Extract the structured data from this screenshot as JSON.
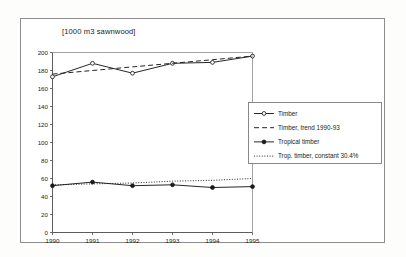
{
  "figure": {
    "title": "[1000 m3 sawnwood]",
    "frame_color": "#8d8d8d",
    "background": "#ffffff"
  },
  "chart_data": {
    "type": "line",
    "title": "[1000 m3 sawnwood]",
    "xlabel": "",
    "ylabel": "",
    "x": [
      1990,
      1991,
      1992,
      1993,
      1994,
      1995
    ],
    "categories": [
      "1990",
      "1991",
      "1992",
      "1993",
      "1994",
      "1995"
    ],
    "xlim": [
      1990,
      1995
    ],
    "ylim": [
      0,
      200
    ],
    "yticks": [
      0,
      20,
      40,
      60,
      80,
      100,
      120,
      140,
      160,
      180,
      200
    ],
    "ytick_labels": [
      "0",
      "20",
      "40",
      "60",
      "80",
      "100",
      "120",
      "140",
      "160",
      "180",
      "200"
    ],
    "xticks": [
      1990,
      1991,
      1992,
      1993,
      1994,
      1995
    ],
    "xtick_labels": [
      "1990",
      "1991",
      "1992",
      "1993",
      "1994",
      "1995"
    ],
    "grid": false,
    "legend_position": "right-outside",
    "series": [
      {
        "name": "Timber",
        "style": "solid",
        "marker": "open-circle",
        "color": "#1a1a1a",
        "values": [
          173,
          188,
          177,
          188,
          189,
          196
        ]
      },
      {
        "name": "Timber, trend 1990-93",
        "style": "dashed",
        "marker": "none",
        "color": "#1a1a1a",
        "values": [
          176,
          180,
          184,
          188,
          192,
          196
        ]
      },
      {
        "name": "Tropical timber",
        "style": "solid",
        "marker": "filled-circle",
        "color": "#1a1a1a",
        "values": [
          52,
          56,
          52,
          53,
          50,
          51
        ]
      },
      {
        "name": "Trop. timber, constant 30.4%",
        "style": "dotted",
        "marker": "none",
        "color": "#1a1a1a",
        "values": [
          53,
          54,
          55,
          57,
          58,
          60
        ]
      }
    ]
  },
  "legend": {
    "items": [
      {
        "label": "Timber",
        "style": "solid",
        "marker": "open-circle"
      },
      {
        "label": "Timber, trend 1990-93",
        "style": "dashed",
        "marker": "none"
      },
      {
        "label": "Tropical timber",
        "style": "solid",
        "marker": "filled-circle"
      },
      {
        "label": "Trop. timber, constant 30.4%",
        "style": "dotted",
        "marker": "none"
      }
    ]
  }
}
